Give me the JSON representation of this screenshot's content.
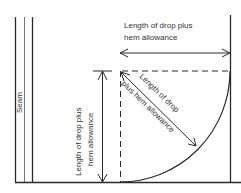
{
  "diagram": {
    "labels": {
      "seam": "Seam",
      "top_line1": "Length of drop plus",
      "top_line2": "hem allowance",
      "left_line1": "Length of drop plus",
      "left_line2": "hem allowance",
      "diag_line1": "Length of drop",
      "diag_line2": "plus hem allowance"
    },
    "colors": {
      "line": "#2a2a2a",
      "text": "#333333",
      "background": "#ffffff"
    }
  }
}
